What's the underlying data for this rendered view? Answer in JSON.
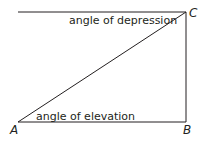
{
  "diagram": {
    "type": "right-triangle",
    "points": {
      "A": "A",
      "B": "B",
      "C": "C"
    },
    "labels": {
      "depression": "angle of depression",
      "elevation": "angle of elevation"
    },
    "colors": {
      "line": "#231f20",
      "background": "#ffffff"
    }
  }
}
